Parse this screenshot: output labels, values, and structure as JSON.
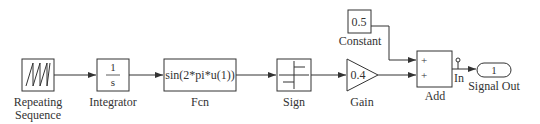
{
  "diagram": {
    "type": "simulink-block-diagram",
    "blocks": [
      {
        "id": "repeating_sequence",
        "label_line1": "Repeating",
        "label_line2": "Sequence",
        "icon": "sawtooth-wave-icon"
      },
      {
        "id": "integrator",
        "label": "Integrator",
        "numerator": "1",
        "denominator": "s"
      },
      {
        "id": "fcn",
        "label": "Fcn",
        "expression": "sin(2*pi*u(1))"
      },
      {
        "id": "sign",
        "label": "Sign",
        "icon": "sign-function-icon"
      },
      {
        "id": "gain",
        "label": "Gain",
        "value": "0.4"
      },
      {
        "id": "constant",
        "label": "Constant",
        "value": "0.5"
      },
      {
        "id": "add",
        "label": "Add",
        "input1_sign": "+",
        "input2_sign": "+"
      },
      {
        "id": "signal_out",
        "label": "Signal Out",
        "port_number": "1"
      }
    ],
    "signal_label": "In",
    "connections": [
      [
        "repeating_sequence",
        "integrator"
      ],
      [
        "integrator",
        "fcn"
      ],
      [
        "fcn",
        "sign"
      ],
      [
        "sign",
        "gain"
      ],
      [
        "gain",
        "add"
      ],
      [
        "constant",
        "add"
      ],
      [
        "add",
        "signal_out"
      ]
    ],
    "colors": {
      "line": "#333333",
      "background": "#ffffff"
    }
  }
}
